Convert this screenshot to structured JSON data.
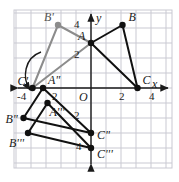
{
  "figure": {
    "background_color": "#ffffff",
    "grid_color": "#c9c9d2",
    "axis_color": "#1a1a1a",
    "primary_color": "#111111",
    "secondary_color": "#8c8c8c"
  },
  "axes": {
    "x_label": "x",
    "y_label": "y",
    "origin_label": "O",
    "x_ticks": [
      {
        "text": "-4",
        "value": -4
      },
      {
        "text": "2",
        "value": 2
      },
      {
        "text": "4",
        "value": 4
      }
    ],
    "y_ticks": [
      {
        "text": "4",
        "value": 4
      },
      {
        "text": "2",
        "value": 2
      },
      {
        "text": "2",
        "value": -2
      },
      {
        "text": "4",
        "value": -4
      }
    ],
    "xlim": [
      -5.8,
      5.6
    ],
    "ylim": [
      -5.5,
      5.3
    ],
    "grid": true
  },
  "points": [
    {
      "name": "A",
      "label": "A",
      "x": 0.0,
      "y": 3.0,
      "color": "#111111",
      "label_dx": -13,
      "label_dy": -13
    },
    {
      "name": "B",
      "label": "B",
      "x": 2.1,
      "y": 4.2,
      "color": "#111111",
      "label_dx": 6,
      "label_dy": -14
    },
    {
      "name": "C",
      "label": "C",
      "x": 3.1,
      "y": 0.0,
      "color": "#111111",
      "label_dx": 5,
      "label_dy": -14
    },
    {
      "name": "Aprime",
      "label": "A\"",
      "x": -3.2,
      "y": 0.0,
      "color": "#111111",
      "label_dx": 5,
      "label_dy": -14
    },
    {
      "name": "Bprime",
      "label": "B'",
      "x": -2.2,
      "y": 4.2,
      "color": "#8c8c8c",
      "label_dx": -14,
      "label_dy": -14
    },
    {
      "name": "Cprime",
      "label": "C'",
      "x": -3.9,
      "y": 0.0,
      "color": "#111111",
      "label_dx": -15,
      "label_dy": -13
    },
    {
      "name": "A3",
      "label": "A'''",
      "x": -2.9,
      "y": -1.0,
      "color": "#111111",
      "label_dx": 2,
      "label_dy": 3
    },
    {
      "name": "B2",
      "label": "B\"",
      "x": -4.5,
      "y": -2.0,
      "color": "#111111",
      "label_dx": -18,
      "label_dy": -5
    },
    {
      "name": "B3",
      "label": "B'''",
      "x": -4.2,
      "y": -3.0,
      "color": "#111111",
      "label_dx": -19,
      "label_dy": 4
    },
    {
      "name": "C2",
      "label": "C\"",
      "x": 0.0,
      "y": -3.0,
      "color": "#111111",
      "label_dx": 6,
      "label_dy": -4
    },
    {
      "name": "C3",
      "label": "C'''",
      "x": 0.0,
      "y": -4.0,
      "color": "#111111",
      "label_dx": 6,
      "label_dy": 0
    }
  ],
  "polygons": [
    {
      "name": "triangle-ABC",
      "vertices": [
        "A",
        "B",
        "C"
      ],
      "color": "#111111",
      "width": 2.0
    },
    {
      "name": "triangle-primed",
      "vertices": [
        "A",
        "Bprime",
        "Cprime"
      ],
      "color": "#8c8c8c",
      "width": 2.0
    },
    {
      "name": "triangle-double",
      "vertices": [
        "Aprime",
        "B2",
        "C2"
      ],
      "color": "#111111",
      "width": 2.0
    },
    {
      "name": "triangle-triple",
      "vertices": [
        "A3",
        "B3",
        "C3"
      ],
      "color": "#111111",
      "width": 2.0
    }
  ],
  "annotations": {
    "rotation_arc": {
      "name": "rotation-arc-arrow",
      "description": "curved arrow indicating rotation about C'"
    }
  }
}
